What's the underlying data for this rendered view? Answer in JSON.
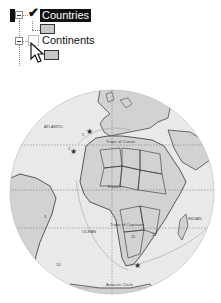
{
  "layer_tree": {
    "items": [
      {
        "label": "Countries",
        "checked": true,
        "selected": true,
        "swatch_color": "#c8c8c8"
      },
      {
        "label": "Continents",
        "checked": false,
        "selected": false,
        "swatch_color": "#c8c8c8"
      }
    ]
  },
  "map": {
    "labels": {
      "atlantic": "ATLANTIC",
      "ocean": "OCEAN",
      "indian": "INDIAN",
      "tropic_cancer": "Tropic of Cancer",
      "equator": "Equator",
      "tropic_capricorn": "Tropic of Capricorn",
      "antarctic_circle": "Antarctic Circle"
    },
    "markers": [
      "1",
      "2",
      "3",
      "11",
      "12",
      "13"
    ],
    "colors": {
      "ocean": "#e9e9e9",
      "land": "#d2d2d2",
      "border": "#333333"
    }
  }
}
